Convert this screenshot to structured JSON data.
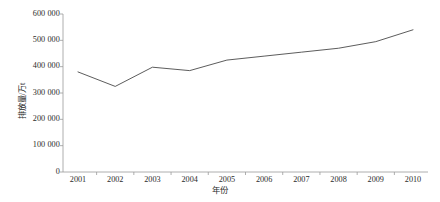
{
  "chart_data": {
    "type": "line",
    "title": "",
    "subtitle": "",
    "xlabel": "年份",
    "ylabel": "排放量/万t",
    "categories": [
      "2001",
      "2002",
      "2003",
      "2004",
      "2005",
      "2006",
      "2007",
      "2008",
      "2009",
      "2010"
    ],
    "x": [
      2001,
      2002,
      2003,
      2004,
      2005,
      2006,
      2007,
      2008,
      2009,
      2010
    ],
    "values": [
      380000,
      325000,
      398000,
      385000,
      425000,
      440000,
      455000,
      470000,
      495000,
      540000
    ],
    "series": [
      {
        "name": "排放量",
        "values": [
          380000,
          325000,
          398000,
          385000,
          425000,
          440000,
          455000,
          470000,
          495000,
          540000
        ]
      }
    ],
    "ylim": [
      0,
      600000
    ],
    "xlim": [
      2001,
      2010
    ],
    "ytick_values": [
      0,
      100000,
      200000,
      300000,
      400000,
      500000,
      600000
    ],
    "ytick_labels": [
      "0",
      "100 000",
      "200 000",
      "300 000",
      "400 000",
      "500 000",
      "600 000"
    ],
    "xtick_labels": [
      "2001",
      "2002",
      "2003",
      "2004",
      "2005",
      "2006",
      "2007",
      "2008",
      "2009",
      "2010"
    ],
    "grid": false,
    "legend": "none",
    "line_color": "#4a4a4a",
    "axis_color": "#9a9a9a",
    "background_color": "#ffffff"
  }
}
